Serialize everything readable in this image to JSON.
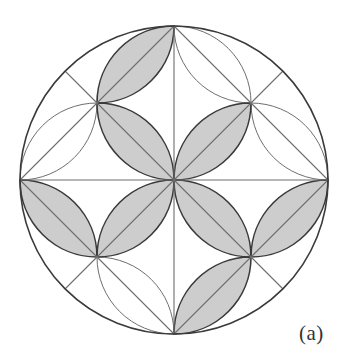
{
  "figure": {
    "label": "(a)",
    "center": [
      174,
      180
    ],
    "outer_radius": 154,
    "step": 77,
    "colors": {
      "background": "#ffffff",
      "fill": "#cdcdcd",
      "stroke_heavy": "#3a3a3a",
      "stroke_light": "#6e6e6e"
    },
    "points": {
      "C": [
        174,
        180
      ],
      "N": [
        174,
        26
      ],
      "E": [
        328,
        180
      ],
      "S": [
        174,
        334
      ],
      "W": [
        20,
        180
      ],
      "M_NW": [
        97,
        103
      ],
      "M_NE": [
        251,
        103
      ],
      "M_SW": [
        97,
        257
      ],
      "M_SE": [
        251,
        257
      ]
    },
    "shaded_lenses": [
      [
        "N",
        "M_NW"
      ],
      [
        "M_NW",
        "C"
      ],
      [
        "M_NE",
        "C"
      ],
      [
        "W",
        "M_SW"
      ],
      [
        "M_SW",
        "C"
      ],
      [
        "C",
        "M_SE"
      ],
      [
        "M_SE",
        "E"
      ],
      [
        "M_SE",
        "S"
      ]
    ],
    "unshaded_lenses": [
      [
        "M_NW",
        "W"
      ],
      [
        "N",
        "M_NE"
      ],
      [
        "M_NE",
        "E"
      ],
      [
        "M_SW",
        "S"
      ]
    ],
    "lines": [
      [
        "N",
        "S"
      ],
      [
        "W",
        "E"
      ],
      [
        "N",
        "W"
      ],
      [
        "N",
        "E"
      ],
      [
        "S",
        "W"
      ],
      [
        "S",
        "E"
      ],
      [
        "M_NW",
        "C"
      ],
      [
        "M_NE",
        "C"
      ],
      [
        "M_SW",
        "C"
      ],
      [
        "M_SE",
        "C"
      ]
    ],
    "outward_segments": [
      [
        [
          97,
          103
        ],
        [
          65,
          71
        ]
      ],
      [
        [
          251,
          103
        ],
        [
          283,
          71
        ]
      ],
      [
        [
          97,
          257
        ],
        [
          65,
          289
        ]
      ],
      [
        [
          251,
          257
        ],
        [
          283,
          289
        ]
      ]
    ]
  }
}
